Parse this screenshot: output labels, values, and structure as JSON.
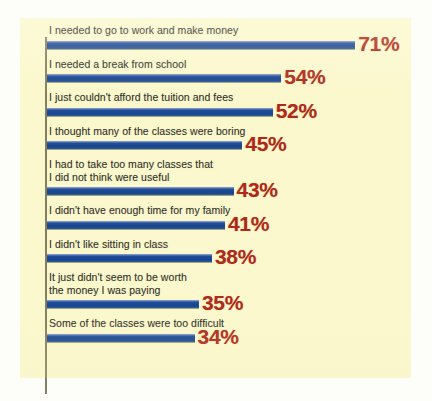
{
  "chart_data": {
    "type": "bar",
    "orientation": "horizontal",
    "title": "",
    "subtitle": "",
    "xlabel": "",
    "ylabel": "",
    "xlim": [
      0,
      80
    ],
    "grid": false,
    "legend": null,
    "value_suffix": "%",
    "categories": [
      "I needed to go to work and make money",
      "I needed a break from school",
      "I just couldn't afford the tuition and fees",
      "I thought many of the classes were boring",
      "I had to take too many classes that\n  I did not think were useful",
      "I didn't have enough time for my family",
      "I didn't like sitting in class",
      "It just didn't seem to be worth\n  the money I was paying",
      "Some of the classes were too difficult"
    ],
    "values": [
      71,
      54,
      52,
      45,
      43,
      41,
      38,
      35,
      34
    ],
    "value_labels": [
      "71%",
      "54%",
      "52%",
      "45%",
      "43%",
      "41%",
      "38%",
      "35%",
      "34%"
    ],
    "bars": [
      {
        "label": "I needed to go to work and make money",
        "value": 71,
        "value_label": "71%",
        "lines": 1
      },
      {
        "label": "I needed a break from school",
        "value": 54,
        "value_label": "54%",
        "lines": 1
      },
      {
        "label": "I just couldn't afford the tuition and fees",
        "value": 52,
        "value_label": "52%",
        "lines": 1
      },
      {
        "label": "I thought many of the classes were boring",
        "value": 45,
        "value_label": "45%",
        "lines": 1
      },
      {
        "label": "I had to take too many classes that\n  I did not think were useful",
        "value": 43,
        "value_label": "43%",
        "lines": 2
      },
      {
        "label": "I didn't have enough time for my family",
        "value": 41,
        "value_label": "41%",
        "lines": 1
      },
      {
        "label": "I didn't like sitting in class",
        "value": 38,
        "value_label": "38%",
        "lines": 1
      },
      {
        "label": "It just didn't seem to be worth\n  the money I was paying",
        "value": 35,
        "value_label": "35%",
        "lines": 2
      },
      {
        "label": "Some of the classes were too difficult",
        "value": 34,
        "value_label": "34%",
        "lines": 1
      }
    ]
  },
  "colors": {
    "panel_background": "#fbf8cd",
    "page_background": "#fdfdfa",
    "bar": "#1d4c98",
    "value_text": "#ae2a18",
    "label_text": "#2f2f2c",
    "axis_line": "#6d6a4a"
  }
}
